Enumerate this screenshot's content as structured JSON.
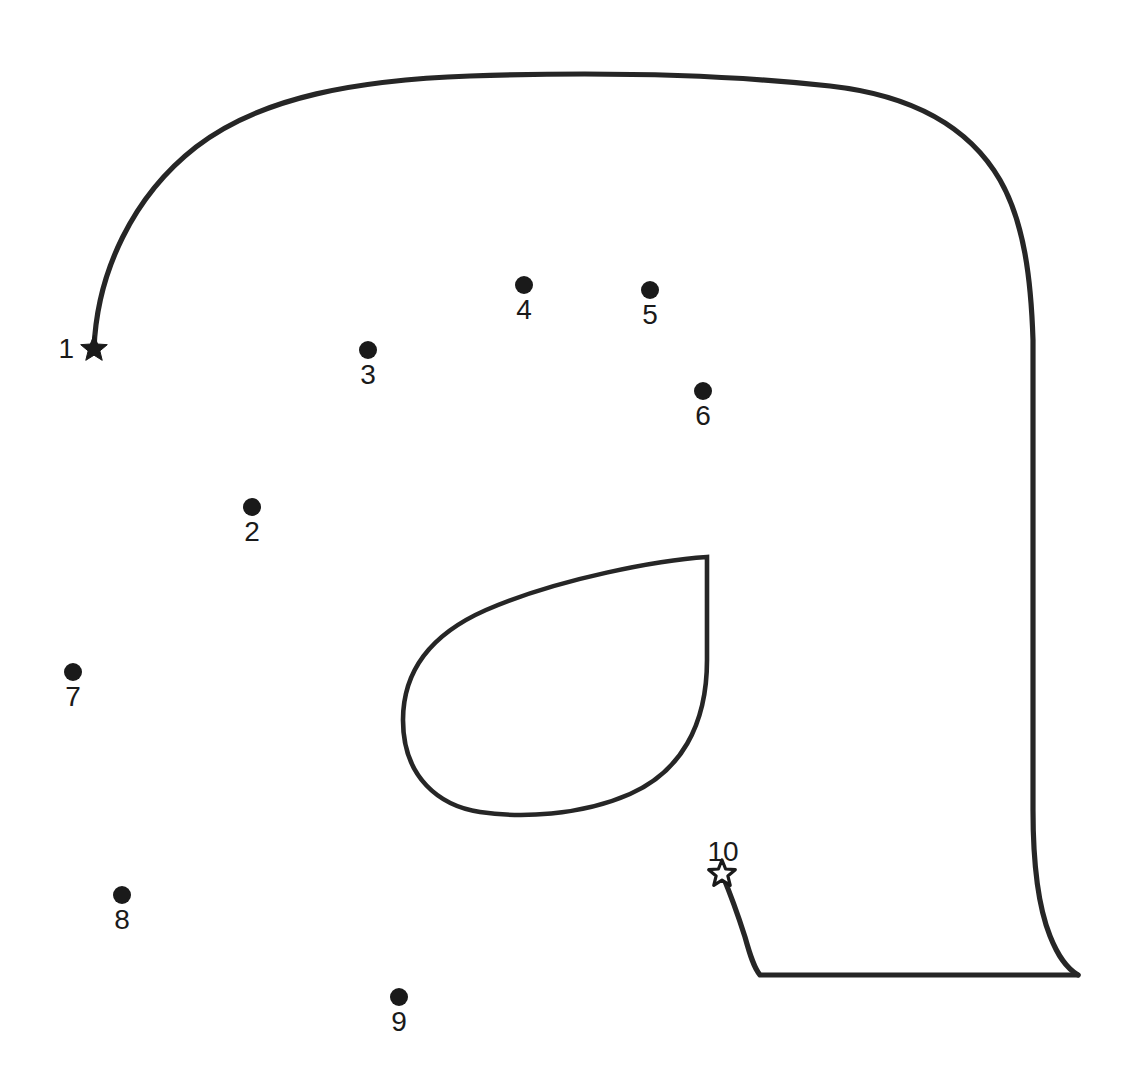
{
  "page": {
    "background_color": "#ffffff",
    "ink_color": "#1a1a1a",
    "stroke_color": "#262626",
    "width": 1142,
    "height": 1083
  },
  "dots": [
    {
      "number": "1",
      "marker": "star-filled",
      "x": 94,
      "y": 349,
      "label_x": 74,
      "label_y": 358,
      "label_pos": "left"
    },
    {
      "number": "2",
      "marker": "dot",
      "x": 252,
      "y": 507,
      "label_x": 252,
      "label_y": 541,
      "label_pos": "below"
    },
    {
      "number": "3",
      "marker": "dot",
      "x": 368,
      "y": 350,
      "label_x": 368,
      "label_y": 384,
      "label_pos": "below"
    },
    {
      "number": "4",
      "marker": "dot",
      "x": 524,
      "y": 285,
      "label_x": 524,
      "label_y": 319,
      "label_pos": "below"
    },
    {
      "number": "5",
      "marker": "dot",
      "x": 650,
      "y": 290,
      "label_x": 650,
      "label_y": 324,
      "label_pos": "below"
    },
    {
      "number": "6",
      "marker": "dot",
      "x": 703,
      "y": 391,
      "label_x": 703,
      "label_y": 425,
      "label_pos": "below"
    },
    {
      "number": "7",
      "marker": "dot",
      "x": 73,
      "y": 672,
      "label_x": 73,
      "label_y": 706,
      "label_pos": "below"
    },
    {
      "number": "8",
      "marker": "dot",
      "x": 122,
      "y": 895,
      "label_x": 122,
      "label_y": 929,
      "label_pos": "below"
    },
    {
      "number": "9",
      "marker": "dot",
      "x": 399,
      "y": 997,
      "label_x": 399,
      "label_y": 1031,
      "label_pos": "below"
    },
    {
      "number": "10",
      "marker": "star-hollow",
      "x": 722,
      "y": 874,
      "label_x": 723,
      "label_y": 861,
      "label_pos": "above"
    }
  ],
  "dot_radius": 9,
  "star_radius_filled": 14,
  "star_radius_hollow": 14,
  "shapes": {
    "body_outline": "M 94 349 C 97 272 133 196 196 147 C 262 96 360 80 470 76 C 590 72 720 74 830 86 C 910 95 968 125 1000 180 C 1024 222 1031 278 1033 340 L 1033 810 C 1033 862 1038 906 1050 936 C 1058 956 1066 968 1078 975",
    "leg_outline": "M 722 874 C 730 893 738 915 745 937 C 750 955 754 968 760 975 L 1078 975",
    "ear_outline": "M 707 557 L 707 660 C 707 726 680 772 630 794 C 580 816 520 818 480 812 C 440 806 403 778 403 720 C 403 666 436 632 486 610 C 560 578 660 560 707 557 Z"
  },
  "ear_detail": {
    "description": "teardrop shaped ear with sharp tip at top right",
    "tip_x": 707,
    "tip_y": 557
  }
}
